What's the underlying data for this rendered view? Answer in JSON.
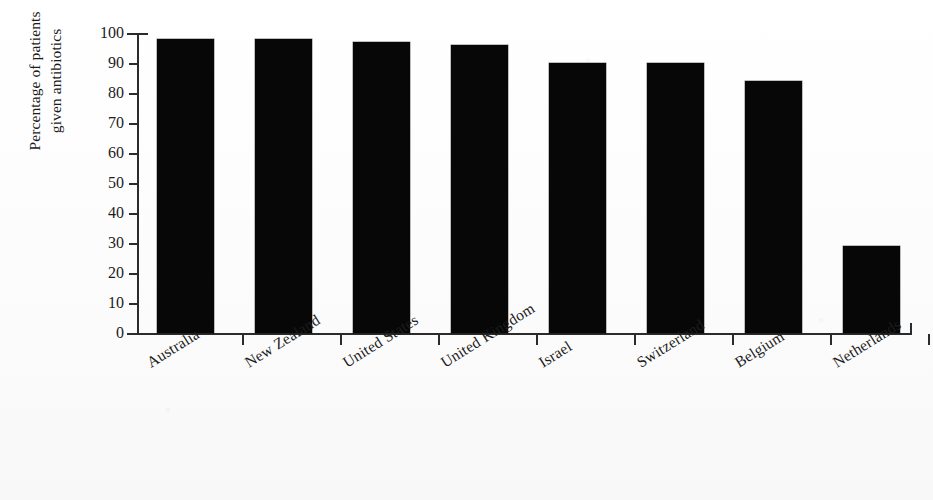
{
  "chart_data": {
    "type": "bar",
    "title": "",
    "subtitle": "",
    "xlabel": "",
    "ylabel": "Percentage of patients given antibiotics",
    "ylabel_lines": [
      "Percentage of patients",
      "given antibiotics"
    ],
    "categories": [
      "Australia",
      "New Zealand",
      "United States",
      "United Kingdom",
      "Israel",
      "Switzerland",
      "Belgium",
      "Netherlands"
    ],
    "values": [
      98,
      98,
      97,
      96,
      90,
      90,
      84,
      29
    ],
    "ylim": [
      0,
      100
    ],
    "ytick_values": [
      0,
      10,
      20,
      30,
      40,
      50,
      60,
      70,
      80,
      90,
      100
    ],
    "ytick_labels": [
      "0",
      "10",
      "20",
      "30",
      "40",
      "50",
      "60",
      "70",
      "80",
      "90",
      "100"
    ],
    "grid": false,
    "legend": "none",
    "bar_color": "#070707",
    "axis_color": "#2b2b2b",
    "background_color": "#fdfdfd",
    "orientation": "vertical",
    "xtick_style": "between-bars",
    "xlabel_rotation_degrees": -32
  }
}
